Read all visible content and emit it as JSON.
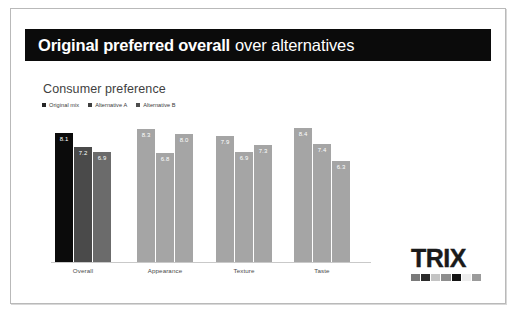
{
  "slide": {
    "title_strong": "Original preferred overall",
    "title_light": "over alternatives",
    "chart_heading": "Consumer preference"
  },
  "legend": {
    "items": [
      {
        "label": "Original mix",
        "color": "#262626"
      },
      {
        "label": "Alternative A",
        "color": "#3f3f3f"
      },
      {
        "label": "Alternative B",
        "color": "#4d4d4d"
      }
    ]
  },
  "logo": {
    "word": "TRIX",
    "swatches": [
      "#7a7a7a",
      "#2b2b2b",
      "#c4c4c4",
      "#8e8e8e",
      "#141414",
      "#ededed",
      "#9b9b9b"
    ]
  },
  "chart_data": {
    "type": "bar",
    "title": "Consumer preference",
    "xlabel": "",
    "ylabel": "",
    "ylim": [
      0,
      10
    ],
    "grid": false,
    "legend_position": "top-left",
    "categories": [
      "Overall",
      "Appearance",
      "Texture",
      "Taste"
    ],
    "series": [
      {
        "name": "Original mix",
        "values": [
          8.1,
          8.3,
          7.9,
          8.4
        ],
        "colors": [
          "#0b0b0b",
          "#a5a5a5",
          "#a5a5a5",
          "#a5a5a5"
        ]
      },
      {
        "name": "Alternative A",
        "values": [
          7.2,
          6.8,
          6.9,
          7.4
        ],
        "colors": [
          "#4a4a4a",
          "#a5a5a5",
          "#a5a5a5",
          "#a5a5a5"
        ]
      },
      {
        "name": "Alternative B",
        "values": [
          6.9,
          8.0,
          7.3,
          6.3
        ],
        "colors": [
          "#6b6b6b",
          "#a5a5a5",
          "#a5a5a5",
          "#a5a5a5"
        ]
      }
    ],
    "value_labels": [
      "8.1",
      "7.2",
      "6.9",
      "8.3",
      "6.8",
      "8.0",
      "7.9",
      "6.9",
      "7.3",
      "8.4",
      "7.4",
      "6.3"
    ]
  }
}
